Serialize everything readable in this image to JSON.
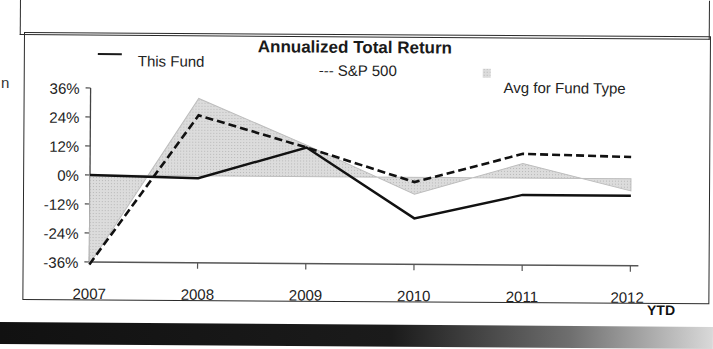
{
  "edge_fragment": "n",
  "chart": {
    "title": "Annualized Total Return",
    "legend": {
      "fund": "This Fund",
      "sp500": "--- S&P 500",
      "avg": "Avg for Fund Type"
    },
    "y_ticks": [
      "36%",
      "24%",
      "12%",
      "0%",
      "-12%",
      "-24%",
      "-36%"
    ],
    "x_ticks": [
      "2007",
      "2008",
      "2009",
      "2010",
      "2011",
      "2012"
    ],
    "x_suffix": "YTD"
  },
  "chart_data": {
    "type": "line",
    "title": "Annualized Total Return",
    "xlabel": "",
    "ylabel": "",
    "categories": [
      "2007",
      "2008",
      "2009",
      "2010",
      "2011",
      "2012 YTD"
    ],
    "series": [
      {
        "name": "This Fund",
        "style": "solid",
        "values": [
          0,
          -1,
          12,
          -17,
          -7,
          -7
        ]
      },
      {
        "name": "S&P 500",
        "style": "dashed",
        "values": [
          -37,
          25,
          12,
          -2,
          10,
          9
        ]
      },
      {
        "name": "Avg for Fund Type",
        "style": "area",
        "values": [
          -37,
          32,
          13,
          -7,
          6,
          -5
        ]
      }
    ],
    "ylim": [
      -36,
      36
    ],
    "y_tick_values": [
      36,
      24,
      12,
      0,
      -12,
      -24,
      -36
    ],
    "grid": false,
    "legend_position": "top"
  }
}
